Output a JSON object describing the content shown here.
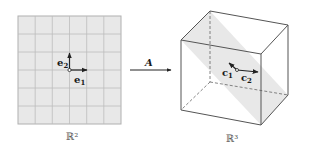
{
  "left_panel": {
    "space_label": "ℝ²",
    "grid": {
      "rows": 6,
      "cols": 6,
      "fill": "#e8e8e8",
      "line": "#b9b9b9"
    },
    "vectors": [
      {
        "name": "e",
        "subscript": "1",
        "direction": "right"
      },
      {
        "name": "e",
        "subscript": "2",
        "direction": "up"
      }
    ]
  },
  "map": {
    "label": "A",
    "direction": "left-to-right"
  },
  "right_panel": {
    "space_label": "ℝ³",
    "shape": "cube",
    "plane_fill": "#e6e6e6",
    "vectors": [
      {
        "name": "c",
        "subscript": "1",
        "direction": "up-left"
      },
      {
        "name": "c",
        "subscript": "2",
        "direction": "right"
      }
    ]
  },
  "colors": {
    "edge": "#555555",
    "text": "#1a1a1a"
  }
}
